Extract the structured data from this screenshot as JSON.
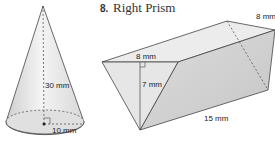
{
  "cone": {
    "height_label": "30 mm",
    "radius_label": "10 mm"
  },
  "prism": {
    "number": "8.",
    "title": "Right Prism",
    "top_width_label": "8 mm",
    "triangle_base_label": "8 mm",
    "triangle_height_label": "7 mm",
    "length_label": "15 mm"
  }
}
